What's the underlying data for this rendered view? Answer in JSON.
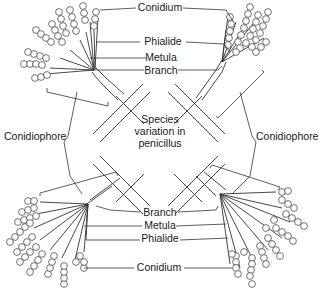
{
  "diagram": {
    "title": "Species variation in penicillus",
    "center_label": {
      "line1": "Species",
      "line2": "variation in",
      "line3": "penicillus"
    },
    "top_labels": {
      "conidium": "Conidium",
      "phialide": "Phialide",
      "metula": "Metula",
      "branch": "Branch"
    },
    "bottom_labels": {
      "branch": "Branch",
      "metula": "Metula",
      "phialide": "Phialide",
      "conidium": "Conidium"
    },
    "side_labels": {
      "left": "Conidiophore",
      "right": "Conidiophore"
    },
    "colors": {
      "line": "#333333",
      "text": "#1a1a1a",
      "background": "#ffffff"
    }
  }
}
